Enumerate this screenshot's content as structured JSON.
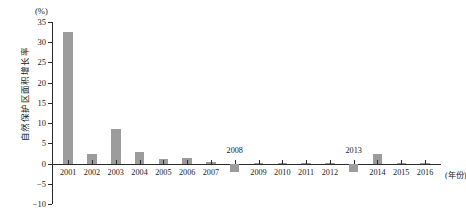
{
  "chart_data": {
    "type": "bar",
    "title": "",
    "subtitle": "",
    "xlabel": "(年份)",
    "ylabel": "自然保护区面积增长率",
    "unit_label": "(%)",
    "categories": [
      "2001",
      "2002",
      "2003",
      "2004",
      "2005",
      "2006",
      "2007",
      "2008",
      "2009",
      "2010",
      "2011",
      "2012",
      "2013",
      "2014",
      "2015",
      "2016"
    ],
    "values": [
      32.5,
      2.4,
      8.5,
      2.8,
      1.2,
      1.4,
      0.3,
      -2.0,
      0.1,
      0.1,
      0.2,
      0.1,
      -2.1,
      2.3,
      0.1,
      0.2
    ],
    "ylim": [
      -10,
      35
    ],
    "ytick_values": [
      -10,
      -5,
      0,
      5,
      10,
      15,
      20,
      25,
      30,
      35
    ],
    "ytick_labels": [
      "-10",
      "-5",
      "0",
      "5",
      "10",
      "15",
      "20",
      "25",
      "30",
      "35"
    ],
    "axis_tick_labels_shown_above_axis": [
      "2008",
      "2013"
    ],
    "grid": false,
    "legend": false,
    "legend_position": "none",
    "series_color": "#9c9c9c",
    "axis_color": "#2b2b2b"
  }
}
